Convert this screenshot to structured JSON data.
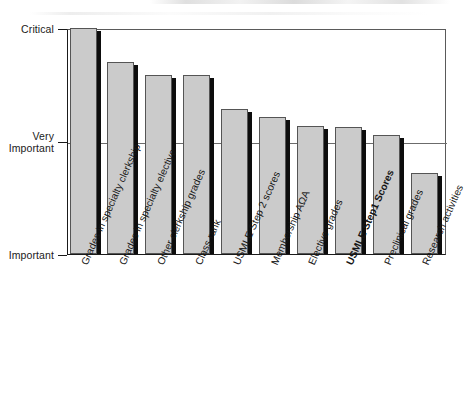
{
  "figure": {
    "background_color": "#ffffff",
    "bar_fill_color": "#cbcbcb",
    "bar_edge_color": "#555555",
    "bar_shadow_color": "#0d0d0d",
    "axis_color": "#1a1a1a",
    "gridline_color": "#6b6b6b"
  },
  "chart_data": {
    "type": "bar",
    "title": "",
    "xlabel": "",
    "ylabel": "",
    "orientation": "vertical",
    "grid": true,
    "legend": false,
    "ylim": [
      1,
      3
    ],
    "ytick_values": [
      1,
      2,
      3
    ],
    "ytick_labels": [
      "Important",
      "Very\nImportant",
      "Critical"
    ],
    "highlighted_category": "USMLE Step1 Scores",
    "categories": [
      "Grades in specialty clerkship",
      "Grades in specialty elective",
      "Other clerkship grades",
      "Class rank",
      "USMLE Step 2 scores",
      "Membership AΩA",
      "Elective grades",
      "USMLE Step1 Scores",
      "Preclinical grades",
      "Research activities"
    ],
    "values": [
      3.0,
      2.7,
      2.58,
      2.58,
      2.28,
      2.21,
      2.13,
      2.12,
      2.05,
      1.72
    ]
  },
  "y_axis": {
    "label_top": "Critical",
    "label_middle": "Very\nImportant",
    "label_bottom": "Important"
  }
}
